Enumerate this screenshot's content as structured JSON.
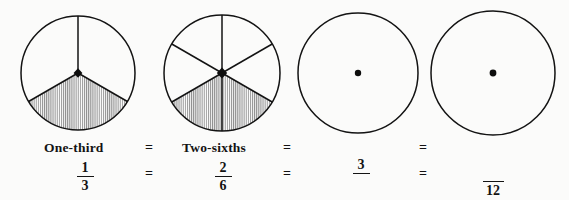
{
  "figure": {
    "kind": "equivalent-fractions-pie-diagram",
    "background_color": "#fbfbfa",
    "ink_color": "#131313",
    "shade_color": "#b9b9b9",
    "circles": [
      {
        "id": "circle-one-third",
        "cx": 78,
        "cy": 73,
        "r": 57,
        "sectors_total": 3,
        "sectors_shaded": 1,
        "center_dot": true,
        "center_dot_style": "large-diamond"
      },
      {
        "id": "circle-two-sixths",
        "cx": 222,
        "cy": 73,
        "r": 58,
        "sectors_total": 6,
        "sectors_shaded": 2,
        "center_dot": true,
        "center_dot_style": "large-diamond"
      },
      {
        "id": "circle-three-over-blank",
        "cx": 358,
        "cy": 73,
        "r": 60,
        "sectors_total": 0,
        "sectors_shaded": 0,
        "center_dot": true,
        "center_dot_style": "small-round"
      },
      {
        "id": "circle-blank-over-twelve",
        "cx": 493,
        "cy": 73,
        "r": 62,
        "sectors_total": 0,
        "sectors_shaded": 0,
        "center_dot": true,
        "center_dot_style": "small-round"
      }
    ]
  },
  "words_row": {
    "label_1": "One-third",
    "equals_1": "=",
    "label_2": "Two-sixths",
    "equals_2": "=",
    "equals_3": "="
  },
  "fractions_row": {
    "fraction_1": {
      "numerator": "1",
      "denominator": "3"
    },
    "equals_1": "=",
    "fraction_2": {
      "numerator": "2",
      "denominator": "6"
    },
    "equals_2": "=",
    "fraction_3": {
      "numerator": "3",
      "denominator": ""
    },
    "equals_3": "=",
    "fraction_4": {
      "numerator": "",
      "denominator": "12"
    }
  }
}
